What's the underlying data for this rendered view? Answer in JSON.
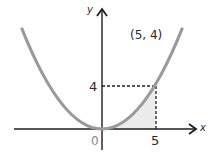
{
  "diagram": {
    "type": "parabola-graph",
    "function": "y = (4/25) x^2",
    "axes": {
      "x_label": "x",
      "y_label": "y",
      "origin_label": "0"
    },
    "point": {
      "label": "(5, 4)",
      "x": 5,
      "y": 4
    },
    "ticks": {
      "x_tick": "5",
      "y_tick": "4"
    },
    "shaded_region": "area under curve from x=0 to x=5",
    "colors": {
      "curve": "#9a9a9a",
      "axes": "#1e1e1e",
      "shade": "#ececec",
      "dashed": "#1e1e1e"
    }
  }
}
